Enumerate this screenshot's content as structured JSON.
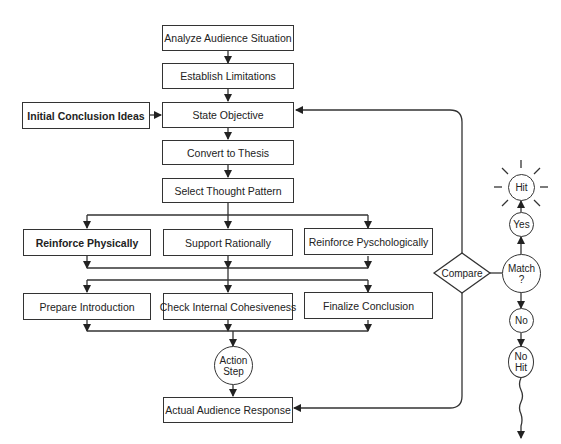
{
  "diagram": {
    "main_flow": [
      {
        "id": "analyze",
        "label": "Analyze Audience Situation"
      },
      {
        "id": "establish",
        "label": "Establish Limitations"
      },
      {
        "id": "state",
        "label": "State Objective"
      },
      {
        "id": "convert",
        "label": "Convert to Thesis"
      },
      {
        "id": "select",
        "label": "Select Thought Pattern"
      }
    ],
    "side_input": {
      "label": "Initial Conclusion Ideas"
    },
    "support_row": [
      {
        "id": "physical",
        "label": "Reinforce Physically"
      },
      {
        "id": "rational",
        "label": "Support Rationally"
      },
      {
        "id": "psych",
        "label": "Reinforce Pyschologically"
      }
    ],
    "finalize_row": [
      {
        "id": "intro",
        "label": "Prepare Introduction"
      },
      {
        "id": "cohesive",
        "label": "Check Internal Cohesiveness"
      },
      {
        "id": "conclusion",
        "label": "Finalize Conclusion"
      }
    ],
    "action_step": {
      "line1": "Action",
      "line2": "Step"
    },
    "response": {
      "label": "Actual Audience Response"
    },
    "compare": {
      "label": "Compare"
    },
    "match": {
      "line1": "Match",
      "line2": "?"
    },
    "yes": {
      "label": "Yes"
    },
    "hit": {
      "label": "Hit"
    },
    "no": {
      "label": "No"
    },
    "no_hit": {
      "line1": "No",
      "line2": "Hit"
    }
  }
}
